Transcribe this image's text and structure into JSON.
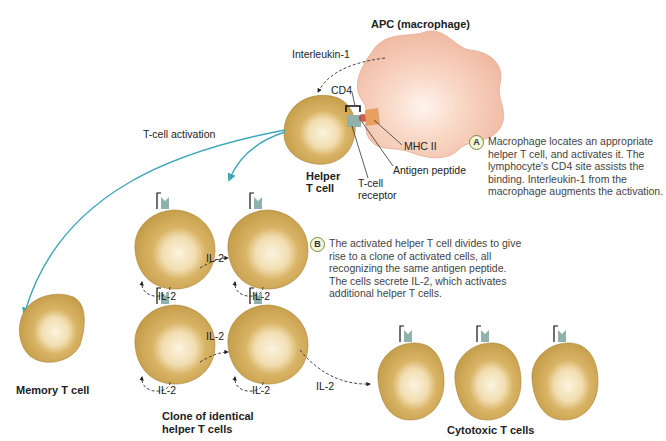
{
  "title_apc": "APC (macrophage)",
  "labels": {
    "interleukin1": "Interleukin-1",
    "cd4": "CD4",
    "mhc2": "MHC II",
    "antigen": "Antigen peptide",
    "tcr_line1": "T-cell",
    "tcr_line2": "receptor",
    "helper_line1": "Helper",
    "helper_line2": "T cell",
    "activation": "T-cell activation",
    "memory": "Memory T cell",
    "clone_line1": "Clone of identical",
    "clone_line2": "helper T cells",
    "cytotoxic": "Cytotoxic T cells",
    "il2": "IL-2"
  },
  "notes": {
    "a": {
      "badge": "A",
      "lines": [
        "Macrophage locates an appropriate",
        "helper T cell, and activates it. The",
        "lymphocyte's CD4 site assists the",
        "binding. Interleukin-1 from the",
        "macrophage augments the activation."
      ]
    },
    "b": {
      "badge": "B",
      "lines": [
        "The activated helper T cell divides to give",
        "rise to a clone of activated cells, all",
        "recognizing the same antigen peptide.",
        "The cells secrete IL-2, which activates",
        "additional helper T cells."
      ]
    }
  },
  "colors": {
    "cell": "#c9a24a",
    "cell_light": "#f7edd0",
    "macrophage": "#f5c8b4",
    "receptor": "#8fb2ad",
    "arrow": "#3aa6b8"
  }
}
